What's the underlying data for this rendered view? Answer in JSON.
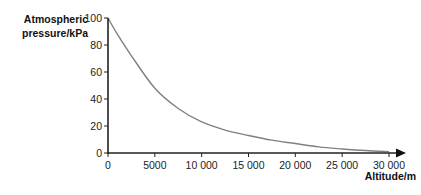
{
  "chart_data": {
    "type": "line",
    "title": "",
    "xlabel": "Altitude/m",
    "ylabel": "Atmospheric pressure/kPa",
    "xlim": [
      0,
      30000
    ],
    "ylim": [
      0,
      100
    ],
    "x_ticks": [
      "0",
      "5000",
      "10 000",
      "15 000",
      "20 000",
      "25 000",
      "30 000"
    ],
    "y_ticks": [
      "0",
      "20",
      "40",
      "60",
      "80",
      "100"
    ],
    "grid": false,
    "legend": null,
    "series": [
      {
        "name": "Atmospheric pressure",
        "color": "#808080",
        "x": [
          0,
          1000,
          2500,
          5000,
          7500,
          10000,
          12500,
          15000,
          17500,
          20000,
          22500,
          25000,
          27500,
          30000
        ],
        "y": [
          100,
          88,
          72,
          48,
          33,
          23,
          17,
          13,
          9.5,
          7,
          4.5,
          3,
          1.8,
          1
        ]
      }
    ]
  },
  "labels": {
    "y_axis_line1": "Atmospheric",
    "y_axis_line2": "pressure/kPa",
    "x_axis": "Altitude/m"
  }
}
